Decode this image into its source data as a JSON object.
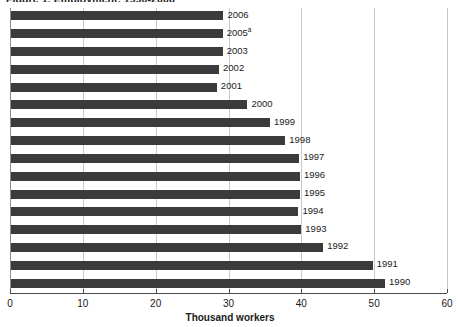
{
  "chart_data": {
    "type": "bar",
    "orientation": "horizontal",
    "title": "Figure 1. Employment, 1990-2006",
    "xlabel": "Thousand workers",
    "ylabel": "",
    "xlim": [
      0,
      60
    ],
    "xticks": [
      0,
      10,
      20,
      30,
      40,
      50,
      60
    ],
    "xticklabels": [
      "0",
      "10",
      "20",
      "30",
      "40",
      "50",
      "60"
    ],
    "grid": true,
    "grid_axis": "x",
    "legend": false,
    "bar_color": "#3b3b3b",
    "categories": [
      "2006",
      "2005",
      "2003",
      "2002",
      "2001",
      "2000",
      "1999",
      "1998",
      "1997",
      "1996",
      "1995",
      "1994",
      "1993",
      "1992",
      "1991",
      "1990"
    ],
    "category_labels": [
      "2006",
      "2005",
      "2003",
      "2002",
      "2001",
      "2000",
      "1999",
      "1998",
      "1997",
      "1996",
      "1995",
      "1994",
      "1993",
      "1992",
      "1991",
      "1990"
    ],
    "footnote_markers": {
      "2005": "a"
    },
    "values": [
      29.3,
      29.2,
      29.2,
      28.7,
      28.4,
      32.6,
      35.7,
      37.8,
      39.7,
      39.8,
      39.8,
      39.6,
      40.0,
      43.0,
      49.8,
      51.5
    ]
  },
  "axis": {
    "x_title": "Thousand workers"
  }
}
